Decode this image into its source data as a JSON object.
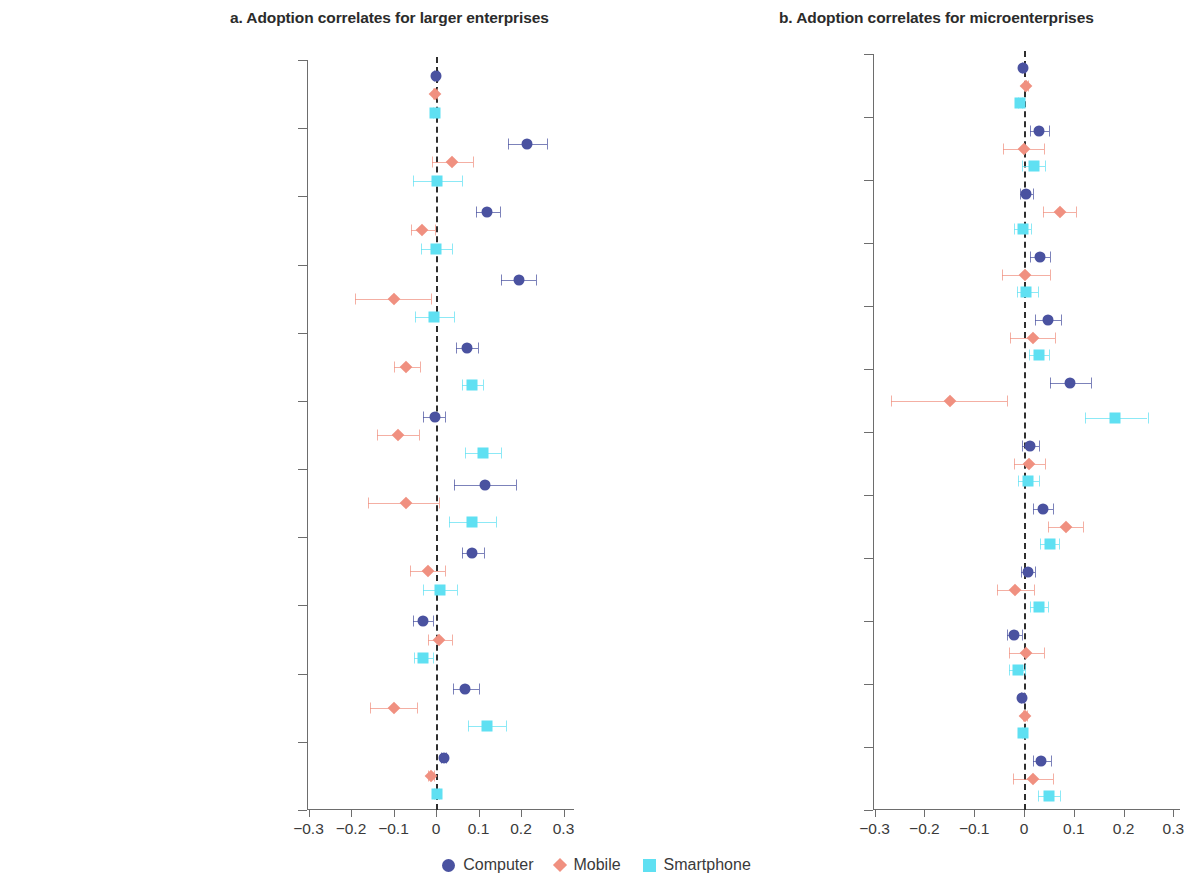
{
  "panels": [
    {
      "id": "a",
      "title": "a. Adoption correlates for larger enterprises",
      "xlabel": "",
      "xticks": [
        "−0.3",
        "−0.2",
        "−0.1",
        "0",
        "0.1",
        "0.2",
        "0.3"
      ]
    },
    {
      "id": "b",
      "title": "b. Adoption correlates for microenterprises",
      "xlabel": "",
      "xticks": [
        "−0.3",
        "−0.2",
        "−0.1",
        "0",
        "0.1",
        "0.2",
        "0.3"
      ]
    }
  ],
  "legend": {
    "items": [
      {
        "label": "Computer",
        "marker": "circle-icon",
        "color": "#4a52a0"
      },
      {
        "label": "Mobile",
        "marker": "diamond-icon",
        "color": "#f09080"
      },
      {
        "label": "Smartphone",
        "marker": "square-icon",
        "color": "#5fe0f2"
      }
    ]
  },
  "colors": {
    "computer": "#4a52a0",
    "mobile": "#f09080",
    "smartphone": "#5fe0f2",
    "axis": "#6d6d6d",
    "zero_line": "#2e2e2e",
    "text": "#3d3d3d"
  },
  "chart_data": [
    {
      "type": "scatter",
      "panel": "a",
      "title": "a. Adoption correlates for larger enterprises",
      "subtitle": "",
      "xlabel": "",
      "ylabel": "",
      "xlim": [
        -0.345,
        0.345
      ],
      "xticks": [
        -0.3,
        -0.2,
        -0.1,
        0,
        0.1,
        0.2,
        0.3
      ],
      "grid": false,
      "zero_reference_line": 0,
      "legend_position": "bottom-center",
      "categories": [
        "Firm age",
        "Formal",
        "Medium",
        "Large",
        "Business relationship with MNCs",
        "Loans for purchasing machine",
        "Have electricity",
        "Located in capital city",
        "Female owner",
        "Manager's education",
        "Manager's experience in MNCs"
      ],
      "series": [
        {
          "name": "Computer",
          "marker": "circle",
          "color": "#4a52a0",
          "values": [
            0.0,
            0.215,
            0.12,
            0.195,
            0.072,
            -0.003,
            0.115,
            0.085,
            -0.03,
            0.068,
            0.018
          ],
          "ci_low": [
            -0.004,
            0.17,
            0.093,
            0.152,
            0.048,
            -0.03,
            0.042,
            0.06,
            -0.055,
            0.04,
            0.012
          ],
          "ci_high": [
            0.004,
            0.262,
            0.15,
            0.235,
            0.098,
            0.02,
            0.188,
            0.112,
            -0.008,
            0.102,
            0.023
          ]
        },
        {
          "name": "Mobile",
          "marker": "diamond",
          "color": "#f09080",
          "values": [
            -0.002,
            0.038,
            -0.032,
            -0.1,
            -0.07,
            -0.09,
            -0.07,
            -0.02,
            0.008,
            -0.1,
            -0.012
          ],
          "ci_low": [
            -0.006,
            -0.01,
            -0.06,
            -0.19,
            -0.1,
            -0.14,
            -0.16,
            -0.062,
            -0.018,
            -0.155,
            -0.02
          ],
          "ci_high": [
            0.002,
            0.088,
            -0.002,
            -0.012,
            -0.038,
            -0.04,
            0.008,
            0.022,
            0.038,
            -0.045,
            -0.004
          ]
        },
        {
          "name": "Smartphone",
          "marker": "square",
          "color": "#5fe0f2",
          "values": [
            -0.002,
            0.002,
            0.0,
            -0.005,
            0.085,
            0.11,
            0.085,
            0.01,
            -0.03,
            0.12,
            0.002
          ],
          "ci_low": [
            -0.007,
            -0.055,
            -0.035,
            -0.05,
            0.062,
            0.068,
            0.03,
            -0.03,
            -0.052,
            0.075,
            -0.004
          ],
          "ci_high": [
            0.004,
            0.06,
            0.038,
            0.042,
            0.11,
            0.152,
            0.14,
            0.05,
            -0.008,
            0.165,
            0.008
          ]
        }
      ]
    },
    {
      "type": "scatter",
      "panel": "b",
      "title": "b. Adoption correlates for microenterprises",
      "subtitle": "",
      "xlabel": "",
      "ylabel": "",
      "xlim": [
        -0.345,
        0.345
      ],
      "xticks": [
        -0.3,
        -0.2,
        -0.1,
        0,
        0.1,
        0.2,
        0.3
      ],
      "grid": false,
      "zero_reference_line": 0,
      "legend_position": "bottom-center",
      "categories": [
        "Firm age",
        "Formal",
        "Medium",
        "Large",
        "Large firms as customers",
        "Have loan",
        "Have credit line with suppliers",
        "Have electricity",
        "Urban location",
        "Female owner",
        "Manager's education",
        "Vocational training"
      ],
      "series": [
        {
          "name": "Computer",
          "marker": "circle",
          "color": "#4a52a0",
          "values": [
            -0.002,
            0.03,
            0.005,
            0.032,
            0.048,
            0.092,
            0.012,
            0.038,
            0.008,
            -0.02,
            -0.004,
            0.035
          ],
          "ci_low": [
            -0.005,
            0.012,
            -0.008,
            0.012,
            0.022,
            0.052,
            -0.005,
            0.018,
            -0.007,
            -0.035,
            -0.007,
            0.018
          ],
          "ci_high": [
            0.002,
            0.05,
            0.018,
            0.052,
            0.075,
            0.135,
            0.03,
            0.058,
            0.022,
            -0.005,
            -0.001,
            0.055
          ]
        },
        {
          "name": "Mobile",
          "marker": "diamond",
          "color": "#f09080",
          "values": [
            0.004,
            0.0,
            0.072,
            0.002,
            0.018,
            -0.148,
            0.01,
            0.085,
            -0.018,
            0.005,
            0.002,
            0.018
          ],
          "ci_low": [
            0.0,
            -0.042,
            0.038,
            -0.045,
            -0.028,
            -0.268,
            -0.02,
            0.048,
            -0.055,
            -0.03,
            -0.002,
            -0.022
          ],
          "ci_high": [
            0.008,
            0.04,
            0.105,
            0.052,
            0.062,
            -0.035,
            0.042,
            0.118,
            0.02,
            0.04,
            0.006,
            0.058
          ]
        },
        {
          "name": "Smartphone",
          "marker": "square",
          "color": "#5fe0f2",
          "values": [
            -0.008,
            0.02,
            -0.002,
            0.005,
            0.03,
            0.182,
            0.008,
            0.052,
            0.03,
            -0.012,
            -0.002,
            0.05
          ],
          "ci_low": [
            -0.012,
            -0.005,
            -0.02,
            -0.015,
            0.01,
            0.122,
            -0.012,
            0.032,
            0.012,
            -0.03,
            -0.005,
            0.028
          ],
          "ci_high": [
            -0.004,
            0.042,
            0.015,
            0.028,
            0.05,
            0.248,
            0.03,
            0.07,
            0.048,
            0.002,
            0.002,
            0.072
          ]
        }
      ]
    }
  ]
}
